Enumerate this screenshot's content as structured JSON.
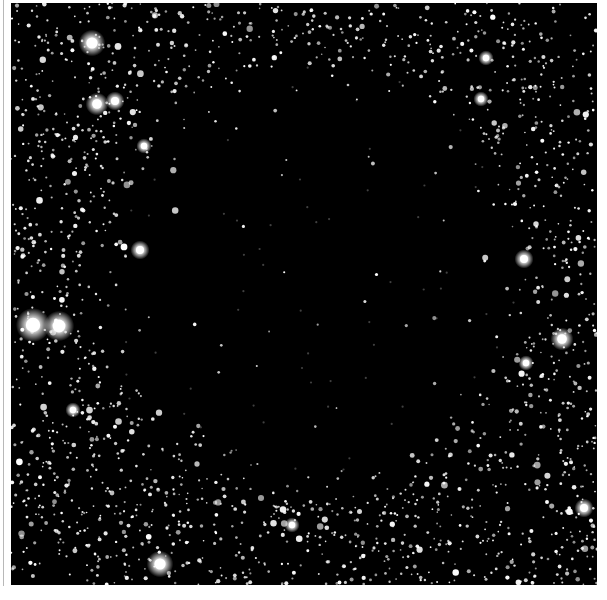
{
  "image": {
    "subject": "Dark nebula silhouetted against a dense star field",
    "background_color": "#ffffff",
    "sky_color": "#000000",
    "star_color": "#ffffff",
    "dark_cloud": {
      "cx": 300,
      "cy": 270,
      "rx": 235,
      "ry": 240
    },
    "bright_stars": [
      {
        "x": 22,
        "y": 322,
        "r": 9
      },
      {
        "x": 48,
        "y": 323,
        "r": 8
      },
      {
        "x": 81,
        "y": 40,
        "r": 7
      },
      {
        "x": 86,
        "y": 101,
        "r": 6
      },
      {
        "x": 104,
        "y": 98,
        "r": 5
      },
      {
        "x": 149,
        "y": 561,
        "r": 7
      },
      {
        "x": 129,
        "y": 247,
        "r": 5
      },
      {
        "x": 133,
        "y": 143,
        "r": 4
      },
      {
        "x": 551,
        "y": 336,
        "r": 6
      },
      {
        "x": 513,
        "y": 256,
        "r": 5
      },
      {
        "x": 573,
        "y": 505,
        "r": 5
      },
      {
        "x": 281,
        "y": 522,
        "r": 4
      },
      {
        "x": 475,
        "y": 55,
        "r": 4
      },
      {
        "x": 470,
        "y": 96,
        "r": 4
      },
      {
        "x": 62,
        "y": 407,
        "r": 4
      },
      {
        "x": 515,
        "y": 360,
        "r": 4
      }
    ],
    "star_count": 3200,
    "seed": 68
  }
}
